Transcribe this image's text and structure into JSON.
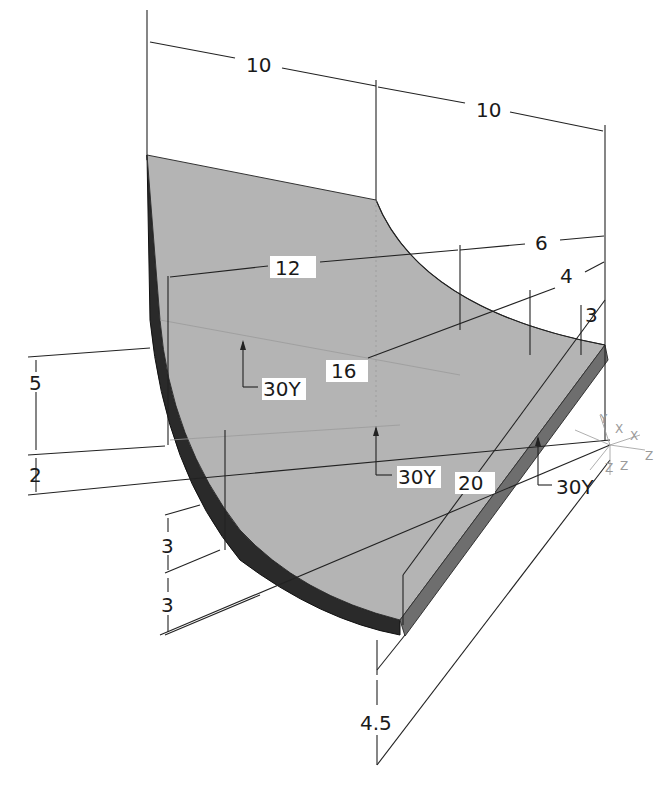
{
  "figure": {
    "type": "isometric-dimensioned-drawing",
    "colors": {
      "top_face": "#b4b4b4",
      "side_face_dark": "#2a2a2a",
      "front_face": "#6e6e6e",
      "lines": "#222222",
      "background": "#ffffff"
    }
  },
  "dimensions": {
    "top_left_10": "10",
    "top_right_10": "10",
    "d12": "12",
    "d6": "6",
    "d4": "4",
    "d3_right": "3",
    "d16": "16",
    "d5": "5",
    "d2": "2",
    "d3_left_upper": "3",
    "d3_left_lower": "3",
    "d20": "20",
    "d4_5": "4.5"
  },
  "angle_labels": {
    "left": "30Y",
    "center": "30Y",
    "right": "30Y"
  },
  "axis_triad": {
    "labels": [
      "Y",
      "X",
      "X",
      "Z",
      "Z",
      "Z"
    ]
  }
}
